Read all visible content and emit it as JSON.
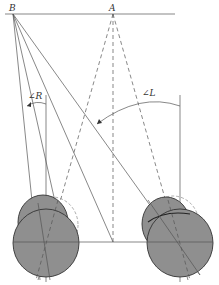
{
  "figure": {
    "type": "vehicle steering geometry diagram",
    "labels": {
      "point_b": "B",
      "point_a": "A",
      "angle_right": "∠R",
      "angle_left": "∠L"
    },
    "colors": {
      "wheel_fill": "#8f8f8f",
      "line": "#555555",
      "background": "#ffffff"
    }
  }
}
